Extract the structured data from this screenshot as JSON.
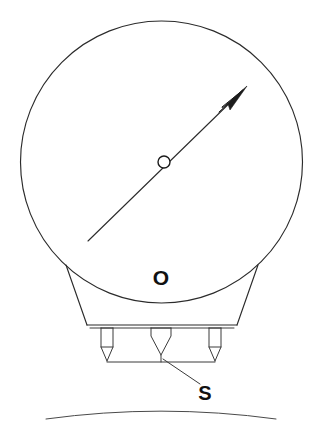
{
  "figure": {
    "background_color": "#ffffff",
    "line_color": "#2b2b2b",
    "width": 321,
    "height": 430
  },
  "labels": {
    "rotor_label": "O",
    "surface_label": "S"
  },
  "geometry": {
    "rotor_circle": {
      "cx": 161.5,
      "cy": 162,
      "r": 141
    },
    "hub_circle": {
      "cx": 164,
      "cy": 162,
      "r": 6
    },
    "spin_axis_arrow": {
      "tail_x": 88,
      "tail_y": 241,
      "tip_x": 247,
      "tip_y": 86
    },
    "support_trapezoid": {
      "top_left_x": 66,
      "top_left_y": 265,
      "top_right_x": 258,
      "top_right_y": 265,
      "bottom_left_x": 87,
      "bottom_left_y": 325,
      "bottom_right_x": 237,
      "bottom_right_y": 325
    },
    "legs_x": [
      107,
      161,
      215
    ],
    "leg_top_y": 326,
    "leg_tip_y": 362,
    "ground_line": {
      "x1": 107,
      "y1": 362,
      "x2": 215,
      "y2": 362
    },
    "earth_arc": {
      "cx": 161,
      "cy": 1200,
      "r": 848
    },
    "leader_line": {
      "x1": 200,
      "y1": 384,
      "x2": 163,
      "y2": 360
    }
  },
  "label_positions": {
    "o_x": 161,
    "o_y": 285,
    "s_x": 205,
    "s_y": 400
  }
}
